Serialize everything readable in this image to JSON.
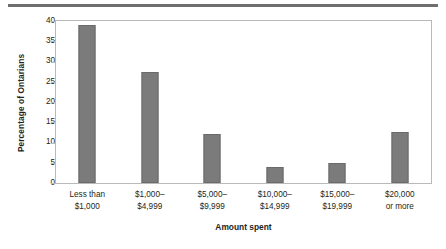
{
  "chart_data": {
    "type": "bar",
    "title": "",
    "subtitle": "",
    "xlabel": "Amount spent",
    "ylabel": "Percentage of Ontarians",
    "categories": [
      "Less than $1,000",
      "$1,000–$4,999",
      "$5,000–$9,999",
      "$10,000–$14,999",
      "$15,000–$19,999",
      "$20,000 or more"
    ],
    "category_lines": [
      [
        "Less than",
        "$1,000"
      ],
      [
        "$1,000–",
        "$4,999"
      ],
      [
        "$5,000–",
        "$9,999"
      ],
      [
        "$10,000–",
        "$14,999"
      ],
      [
        "$15,000–",
        "$19,999"
      ],
      [
        "$20,000",
        "or more"
      ]
    ],
    "values": [
      39,
      27.5,
      12,
      4,
      5,
      12.5
    ],
    "ylim": [
      0,
      40
    ],
    "ytick_values": [
      0,
      5,
      10,
      15,
      20,
      25,
      30,
      35,
      40
    ],
    "ytick_labels": [
      "0",
      "5",
      "10",
      "15",
      "20",
      "25",
      "30",
      "35",
      "40"
    ],
    "grid": false,
    "legend": false,
    "legend_position": "none",
    "bar_color": "#7b7b7b",
    "axis_color": "#b9b9b9",
    "text_color": "#231f20",
    "rule_color": "#6e6e6e"
  }
}
